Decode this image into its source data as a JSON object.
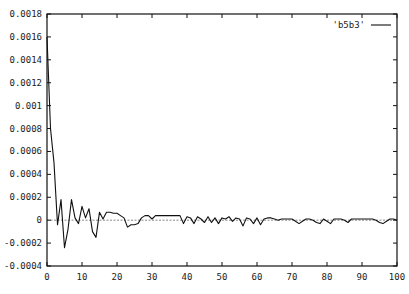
{
  "chart_data": {
    "type": "line",
    "title": "",
    "xlabel": "",
    "ylabel": "",
    "xlim": [
      0,
      100
    ],
    "ylim": [
      -0.0004,
      0.0018
    ],
    "grid": false,
    "legend_position": "top-right",
    "x_ticks": [
      "0",
      "10",
      "20",
      "30",
      "40",
      "50",
      "60",
      "70",
      "80",
      "90",
      "100"
    ],
    "y_ticks": [
      "-0.0004",
      "-0.0002",
      "0",
      "0.0002",
      "0.0004",
      "0.0006",
      "0.0008",
      "0.001",
      "0.0012",
      "0.0014",
      "0.0016",
      "0.0018"
    ],
    "zero_line": true,
    "series": [
      {
        "name": "'b5b3'",
        "x": [
          0,
          1,
          2,
          3,
          4,
          5,
          6,
          7,
          8,
          9,
          10,
          11,
          12,
          13,
          14,
          15,
          16,
          17,
          18,
          19,
          20,
          21,
          22,
          23,
          24,
          25,
          26,
          27,
          28,
          29,
          30,
          31,
          32,
          33,
          34,
          35,
          36,
          37,
          38,
          39,
          40,
          41,
          42,
          43,
          44,
          45,
          46,
          47,
          48,
          49,
          50,
          51,
          52,
          53,
          54,
          55,
          56,
          57,
          58,
          59,
          60,
          61,
          62,
          63,
          64,
          65,
          66,
          67,
          68,
          69,
          70,
          71,
          72,
          73,
          74,
          75,
          76,
          77,
          78,
          79,
          80,
          81,
          82,
          83,
          84,
          85,
          86,
          87,
          88,
          89,
          90,
          91,
          92,
          93,
          94,
          95,
          96,
          97,
          98,
          99,
          100
        ],
        "values": [
          0.0016,
          0.0008,
          0.0005,
          -4e-05,
          0.00018,
          -0.00024,
          -8e-05,
          0.00018,
          2e-05,
          -3e-05,
          0.00012,
          2e-05,
          0.0001,
          -0.0001,
          -0.00015,
          7e-05,
          1e-05,
          7e-05,
          7e-05,
          6e-05,
          6e-05,
          4e-05,
          2e-05,
          -6e-05,
          -4e-05,
          -4e-05,
          -3e-05,
          2e-05,
          4e-05,
          4e-05,
          1e-05,
          4e-05,
          4e-05,
          4e-05,
          4e-05,
          4e-05,
          4e-05,
          4e-05,
          4e-05,
          -3e-05,
          3e-05,
          2e-05,
          -3e-05,
          3e-05,
          1e-05,
          -2e-05,
          3e-05,
          -2e-05,
          2e-05,
          -3e-05,
          2e-05,
          1e-05,
          3e-05,
          -1e-05,
          2e-05,
          1e-05,
          -5e-05,
          2e-05,
          1e-05,
          -3e-05,
          2e-05,
          -4e-05,
          1e-05,
          2e-05,
          2e-05,
          1e-05,
          0.0,
          1e-05,
          1e-05,
          1e-05,
          1e-05,
          -1e-05,
          -3e-05,
          -1e-05,
          1e-05,
          1e-05,
          0.0,
          -2e-05,
          -3e-05,
          1e-05,
          -1e-05,
          -3e-05,
          1e-05,
          1e-05,
          1e-05,
          0.0,
          -2e-05,
          1e-05,
          1e-05,
          1e-05,
          1e-05,
          1e-05,
          1e-05,
          1e-05,
          0.0,
          -2e-05,
          -3e-05,
          -1e-05,
          1e-05,
          1e-05,
          0.0
        ],
        "color": "#111111"
      }
    ]
  },
  "legend": {
    "label": "'b5b3'"
  }
}
